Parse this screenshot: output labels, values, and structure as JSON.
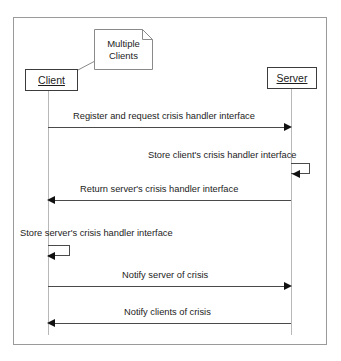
{
  "diagram": {
    "type": "uml-sequence-diagram",
    "frame": {
      "border_color": "#9a9a9a"
    },
    "participants": [
      {
        "id": "client",
        "label": "Client",
        "underlined": true
      },
      {
        "id": "server",
        "label": "Server",
        "underlined": true
      }
    ],
    "note": {
      "line1": "Multiple",
      "line2": "Clients",
      "attached_to": "client"
    },
    "messages": [
      {
        "index": 1,
        "label": "Register and request crisis handler interface",
        "from": "client",
        "to": "server",
        "direction": "right",
        "kind": "call"
      },
      {
        "index": 2,
        "label": "Store client's crisis handler interface",
        "from": "server",
        "to": "server",
        "direction": "self",
        "kind": "self-call"
      },
      {
        "index": 3,
        "label": "Return server's crisis handler interface",
        "from": "server",
        "to": "client",
        "direction": "left",
        "kind": "return"
      },
      {
        "index": 4,
        "label": "Store server's crisis handler interface",
        "from": "client",
        "to": "client",
        "direction": "self",
        "kind": "self-call"
      },
      {
        "index": 5,
        "label": "Notify server of crisis",
        "from": "client",
        "to": "server",
        "direction": "right",
        "kind": "call"
      },
      {
        "index": 6,
        "label": "Notify clients of crisis",
        "from": "server",
        "to": "client",
        "direction": "left",
        "kind": "call"
      }
    ],
    "colors": {
      "line": "#4a4a4a",
      "lifeline": "#b8b8b8",
      "text": "#1c1c1c",
      "arrow": "#111111",
      "box_border": "#3c3c3c"
    }
  }
}
